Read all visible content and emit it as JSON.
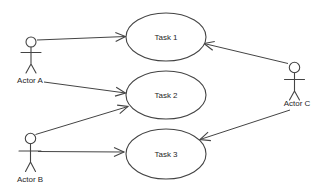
{
  "diagram": {
    "type": "uml-use-case-diagram",
    "background_color": "#ffffff",
    "line_color": "#444444",
    "text_color": "#1f1f1f",
    "use_cases": [
      {
        "label": "Task 1"
      },
      {
        "label": "Task 2"
      },
      {
        "label": "Task 3"
      }
    ],
    "actors": [
      {
        "label": "Actor A"
      },
      {
        "label": "Actor B"
      },
      {
        "label": "Actor C"
      }
    ],
    "associations": [
      {
        "from": "Actor A",
        "to": "Task 1",
        "arrow": "to"
      },
      {
        "from": "Actor A",
        "to": "Task 2",
        "arrow": "to"
      },
      {
        "from": "Actor B",
        "to": "Task 2",
        "arrow": "to"
      },
      {
        "from": "Actor B",
        "to": "Task 3",
        "arrow": "to"
      },
      {
        "from": "Actor C",
        "to": "Task 1",
        "arrow": "to"
      },
      {
        "from": "Actor C",
        "to": "Task 3",
        "arrow": "to"
      }
    ]
  }
}
